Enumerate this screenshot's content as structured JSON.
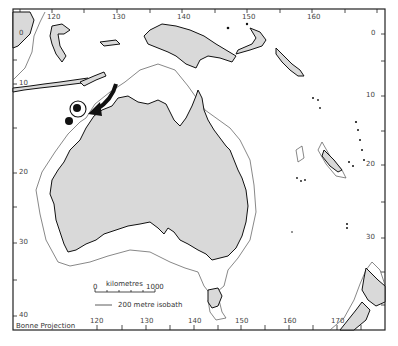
{
  "map": {
    "projection_label": "Bonne Projection",
    "colors": {
      "land": "#d9d9d9",
      "coast": "#111111",
      "isobath": "#555555",
      "frame": "#222222",
      "sea": "#ffffff"
    },
    "top_longitude_labels": [
      {
        "text": "120",
        "x": 52
      },
      {
        "text": "130",
        "x": 117
      },
      {
        "text": "140",
        "x": 182
      },
      {
        "text": "150",
        "x": 247
      },
      {
        "text": "160",
        "x": 312
      }
    ],
    "bottom_longitude_labels": [
      {
        "text": "120",
        "x": 95
      },
      {
        "text": "130",
        "x": 145
      },
      {
        "text": "140",
        "x": 193
      },
      {
        "text": "150",
        "x": 240
      },
      {
        "text": "160",
        "x": 288
      },
      {
        "text": "170",
        "x": 336
      }
    ],
    "left_latitude_labels": [
      {
        "text": "0",
        "y": 33
      },
      {
        "text": "10",
        "y": 84
      },
      {
        "text": "20",
        "y": 172
      },
      {
        "text": "30",
        "y": 242
      },
      {
        "text": "40",
        "y": 316
      }
    ],
    "right_latitude_labels": [
      {
        "text": "0",
        "y": 33
      },
      {
        "text": "10",
        "y": 96
      },
      {
        "text": "20",
        "y": 165
      },
      {
        "text": "30",
        "y": 238
      }
    ],
    "scale_bar": {
      "title": "kilometres",
      "start": "0",
      "end": "1000"
    },
    "isobath_legend": "200 metre isobath",
    "annotations": {
      "arrow": "curved-arrow pointing south-west towards Timor Sea site",
      "site_markers": [
        "circled-dot",
        "solid-dot"
      ]
    }
  }
}
